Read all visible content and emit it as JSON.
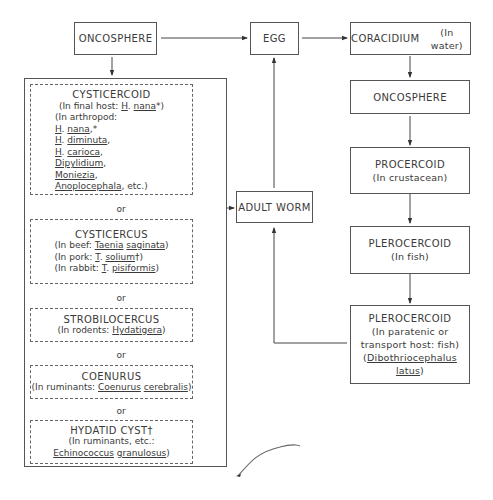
{
  "diagram": {
    "oncosphere_top": "ONCOSPHERE",
    "egg": "EGG",
    "coracidium": {
      "title": "CORACIDIUM",
      "host": "(In water)"
    },
    "adult_worm": "ADULT WORM",
    "right_chain": {
      "oncosphere": "ONCOSPHERE",
      "procercoid": {
        "title": "PROCERCOID",
        "host": "(In crustacean)"
      },
      "plerocercoid_fish": {
        "title": "PLEROCERCOID",
        "host": "(In fish)"
      },
      "plerocercoid_paratenic": {
        "title": "PLEROCERCOID",
        "line1": "(In paratenic or",
        "line2": "transport host:  fish)",
        "species_open": "(",
        "genus": "Dibothriocephalus",
        "species": "latus",
        "species_close": ")"
      }
    },
    "larval_forms": {
      "or_label": "or",
      "cysticercoid": {
        "title": "CYSTICERCOID",
        "final_host_prefix": "(In final host:  ",
        "final_host_genus": "H",
        "final_host_species": "nana",
        "final_host_suffix": "*)",
        "arthropod_prefix": "(In arthropod:",
        "items": [
          {
            "genus": "H",
            "species": "nana",
            "suffix": ",*"
          },
          {
            "genus": "H",
            "species": "diminuta",
            "suffix": ","
          },
          {
            "genus": "H",
            "species": "carioca",
            "suffix": ","
          },
          {
            "genus": "",
            "species": "Dipylidium",
            "suffix": ","
          },
          {
            "genus": "",
            "species": "Moniezia",
            "suffix": ","
          },
          {
            "genus": "",
            "species": "Anoplocephala",
            "suffix": ", etc.)"
          }
        ]
      },
      "cysticercus": {
        "title": "CYSTICERCUS",
        "beef_prefix": "(In beef:  ",
        "beef_genus": "Taenia",
        "beef_species": "saginata",
        "pork_prefix": "(In pork:  ",
        "pork_genus": "T",
        "pork_species": "solium",
        "pork_suffix": "†)",
        "rabbit_prefix": "(In rabbit:  ",
        "rabbit_genus": "T",
        "rabbit_species": "pisiformis",
        "close": ")"
      },
      "strobilocercus": {
        "title": "STROBILOCERCUS",
        "prefix": "(In rodents:  ",
        "genus": "Hydatigera",
        "close": ")"
      },
      "coenurus": {
        "title": "COENURUS",
        "prefix": "(In ruminants:  ",
        "genus": "Coenurus",
        "species": "cerebralis",
        "close": ")"
      },
      "hydatid": {
        "title": "HYDATID CYST†",
        "line1": "(In ruminants, etc.:",
        "genus": "Echinococcus",
        "species": "granulosus",
        "close": ")"
      }
    }
  }
}
